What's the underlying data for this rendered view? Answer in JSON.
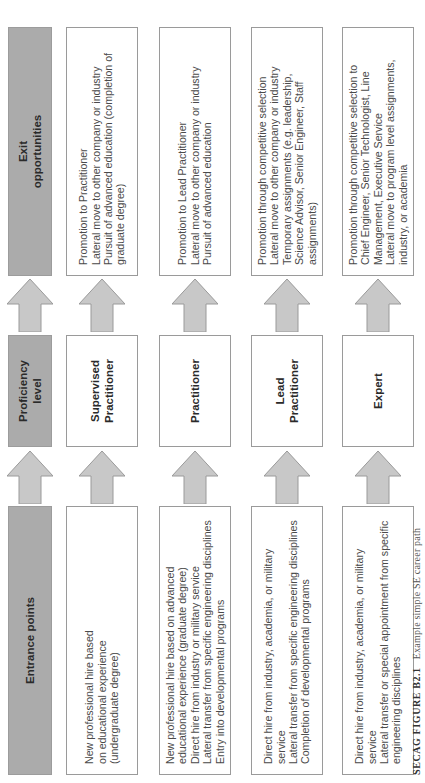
{
  "figure": {
    "caption_label": "SECAG FIGURE B2.1",
    "caption_text": "Example simple SE career path"
  },
  "headers": {
    "entrance": "Entrance points",
    "proficiency": "Proficiency\nlevel",
    "exit": "Exit\nopportunities"
  },
  "colors": {
    "header_fill": "#ababab",
    "arrow_fill": "#c8c8c8",
    "box_border": "#9a9a9a"
  },
  "rows": [
    {
      "entrance": "New professional hire based\non educational experience\n(undergraduate degree)",
      "level": "Supervised\nPractitioner",
      "exit": "Promotion to Practitioner\nLateral move to other company or industry\nPursuit of advanced education (completion of\ngraduate degree)"
    },
    {
      "entrance": "New professional hire based on advanced\neducational experience (graduate degree)\nDirect hire from industry or military service\nLateral transfer from specific engineering disciplines\nEntry into developmental programs",
      "level": "Practitioner",
      "exit": "Promotion to Lead Practitioner\nLateral move to other company or industry\nPursuit of advanced education"
    },
    {
      "entrance": "Direct hire from industry, academia, or military service\nLateral transfer from specific engineering disciplines\nCompletion of developmental programs",
      "level": "Lead\nPractitioner",
      "exit": "Promotion through competitive selection\nLateral move to other company or industry\nTemporary assignments (e.g. leadership,\nScience Advisor, Senior Engineer, Staff\nassignments)"
    },
    {
      "entrance": "Direct hire from industry, academia, or military service\nLateral transfer or special appointment from specific\nengineering disciplines",
      "level": "Expert",
      "exit": "Promotion through competitive selection to\nChief Engineer, Senior Technologist, Line\nManagement, Executive Service\nLateral move to program level assignments,\nindustry, or academia"
    }
  ]
}
